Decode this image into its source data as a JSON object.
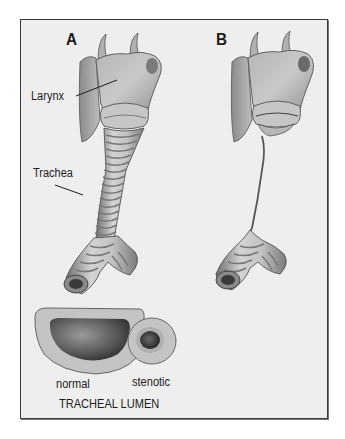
{
  "figure": {
    "panels": [
      {
        "label": "A",
        "description": "normal larynx and trachea"
      },
      {
        "label": "B",
        "description": "larynx with severely narrowed (stenotic) trachea"
      }
    ],
    "annotations": {
      "larynx": "Larynx",
      "trachea": "Trachea"
    },
    "lumen": {
      "normal": "normal",
      "stenotic": "stenotic",
      "caption": "TRACHEAL LUMEN"
    },
    "colors": {
      "background": "#eeeeee",
      "frame": "#3a3a3a",
      "tissue_light": "#cfcfcf",
      "tissue_mid": "#9a9a9a",
      "tissue_dark": "#4a4a4a",
      "text": "#1d1d1d"
    }
  }
}
